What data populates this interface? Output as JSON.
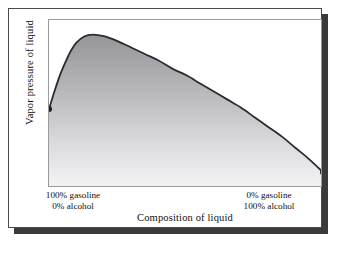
{
  "figure": {
    "axis_titles": {
      "y": "Vapor pressure of liquid",
      "x": "Composition of liquid"
    },
    "tick_labels": {
      "left_line1": "100% gasoline",
      "left_line2": "0% alcohol",
      "right_line1": "0% gasoline",
      "right_line2": "100% alcohol"
    },
    "colors": {
      "frame": "#4a4a4c",
      "shadow": "#3a3a3c",
      "plot_border": "#9a9a9c",
      "curve": "#2b2b2d",
      "fill_top": "#9d9da0",
      "fill_bottom": "#f2f2f3",
      "endpoint": "#1d1d1f",
      "background": "#ffffff"
    }
  },
  "chart_data": {
    "type": "area",
    "title": "",
    "subtitle": "",
    "xlabel": "Composition of liquid",
    "ylabel": "Vapor pressure of liquid",
    "xlim": [
      0,
      100
    ],
    "ylim": [
      0,
      100
    ],
    "grid": false,
    "legend": "none",
    "x_tick_labels": [
      "100% gasoline\n0% alcohol",
      "0% gasoline\n100% alcohol"
    ],
    "x_tick_positions": [
      0,
      100
    ],
    "y_tick_labels": [],
    "series": [
      {
        "name": "Vapor pressure of liquid",
        "shaded": true,
        "endpoints_marked": [
          0,
          100
        ],
        "x": [
          0,
          2,
          4,
          6,
          8,
          10,
          13,
          16,
          20,
          25,
          30,
          35,
          40,
          45,
          50,
          55,
          60,
          65,
          70,
          75,
          80,
          85,
          90,
          95,
          100
        ],
        "values": [
          45,
          56,
          66,
          74,
          81,
          86,
          90,
          91,
          90,
          87,
          83,
          79,
          75,
          70,
          66,
          61,
          56,
          51,
          46,
          40,
          34,
          28,
          21,
          14,
          6
        ]
      }
    ],
    "annotations": [
      {
        "label": "left endpoint dot",
        "x": 0,
        "y": 45
      },
      {
        "label": "maximum",
        "x": 16,
        "y": 91
      },
      {
        "label": "right endpoint dot",
        "x": 100,
        "y": 6
      }
    ]
  }
}
